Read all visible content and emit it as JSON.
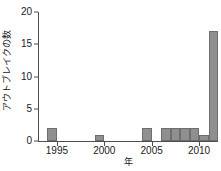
{
  "chart_data": {
    "type": "bar",
    "title": "",
    "subtitle": "",
    "xlabel": "年",
    "ylabel": "アウトブレイクの数",
    "xlim": [
      1993,
      2012
    ],
    "ylim": [
      0,
      20
    ],
    "x_ticks": [
      1995,
      2000,
      2005,
      2010
    ],
    "x_tick_labels": [
      "1995",
      "2000",
      "2005",
      "2010"
    ],
    "y_ticks": [
      0,
      5,
      10,
      15,
      20
    ],
    "y_tick_labels": [
      "0",
      "5",
      "10",
      "15",
      "20"
    ],
    "grid": false,
    "legend": null,
    "bar_color": "#8f8f8f",
    "bar_edge_color": "#6e6e6e",
    "axis_color": "#4d4d4d",
    "background": "#ffffff",
    "bar_width_years": 1,
    "categories": [
      "1994",
      "1995",
      "1996",
      "1997",
      "1998",
      "1999",
      "2000",
      "2001",
      "2002",
      "2003",
      "2004",
      "2005",
      "2006",
      "2007",
      "2008",
      "2009",
      "2010",
      "2011"
    ],
    "values": [
      2,
      0,
      0,
      0,
      0,
      1,
      0,
      0,
      0,
      0,
      2,
      0,
      2,
      2,
      2,
      2,
      1,
      17
    ],
    "bars": [
      {
        "x": 1994,
        "value": 2
      },
      {
        "x": 1999,
        "value": 1
      },
      {
        "x": 2004,
        "value": 2
      },
      {
        "x": 2006,
        "value": 2
      },
      {
        "x": 2007,
        "value": 2
      },
      {
        "x": 2008,
        "value": 2
      },
      {
        "x": 2009,
        "value": 2
      },
      {
        "x": 2010,
        "value": 1
      },
      {
        "x": 2011,
        "value": 17
      }
    ]
  }
}
